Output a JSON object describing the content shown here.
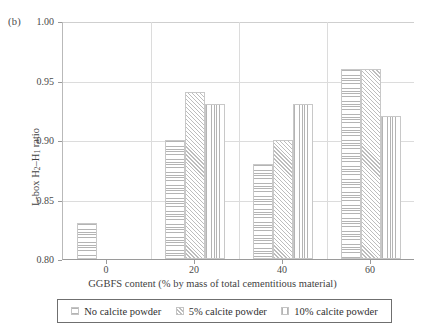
{
  "panel_label": "(b)",
  "chart_data": {
    "type": "bar",
    "title": "",
    "panel": "(b)",
    "xlabel": "GGBFS content (% by mass of total cementitious material)",
    "ylabel": "L-box H2–H1 ratio",
    "ylabel_parts": {
      "prefix": "L-box H",
      "sub1": "2",
      "dash": "–H",
      "sub2": "1",
      "suffix": " ratio"
    },
    "categories": [
      "0",
      "20",
      "40",
      "60"
    ],
    "ylim": [
      0.8,
      1.0
    ],
    "yticks": [
      "1.00",
      "0.95",
      "0.90",
      "0.85",
      "0.80"
    ],
    "ytick_values": [
      1.0,
      0.95,
      0.9,
      0.85,
      0.8
    ],
    "grid": true,
    "legend_position": "bottom",
    "series": [
      {
        "name": "No calcite powder",
        "pattern": "horizontal",
        "values": [
          0.83,
          0.9,
          0.88,
          0.96
        ]
      },
      {
        "name": "5% calcite powder",
        "pattern": "diagonal",
        "values": [
          null,
          0.94,
          0.9,
          0.96
        ]
      },
      {
        "name": "10% calcite powder",
        "pattern": "vertical",
        "values": [
          null,
          0.93,
          0.93,
          0.92
        ]
      }
    ]
  },
  "legend": {
    "items": [
      {
        "label": "No calcite powder",
        "pattern": "horizontal"
      },
      {
        "label": "5% calcite powder",
        "pattern": "diagonal"
      },
      {
        "label": "10% calcite powder",
        "pattern": "vertical"
      }
    ]
  },
  "colors": {
    "axis": "#9a9a9a",
    "grid": "#dcdcdc",
    "hatch": "#b4b4b4",
    "text": "#3b3b3b",
    "legend_border": "#6f6f6f"
  }
}
